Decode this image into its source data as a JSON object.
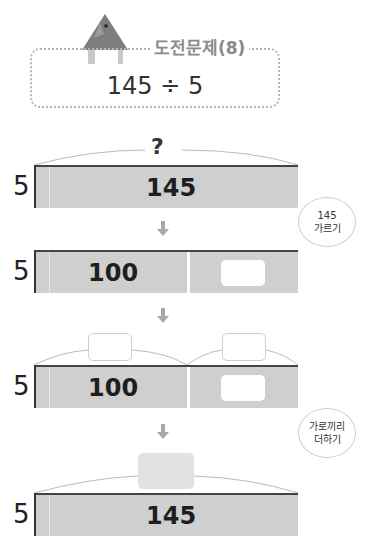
{
  "header": {
    "title": "도전문제(8)",
    "problem": "145 ÷ 5",
    "icon": "triangle-house-icon"
  },
  "steps": [
    {
      "side_label": "5",
      "top_label": "?",
      "segments": [
        {
          "value": "145"
        }
      ]
    },
    {
      "side_label": "5",
      "segments": [
        {
          "value": "100"
        },
        {
          "value": ""
        }
      ]
    },
    {
      "side_label": "5",
      "segments": [
        {
          "value": "100",
          "top_blank": ""
        },
        {
          "value": "",
          "top_blank": ""
        }
      ]
    },
    {
      "side_label": "5",
      "top_blank": "",
      "segments": [
        {
          "value": "145"
        }
      ]
    }
  ],
  "bubbles": [
    {
      "line1": "145",
      "line2": "가르기"
    },
    {
      "line1": "가로끼리",
      "line2": "더하기"
    }
  ],
  "colors": {
    "bar": "#cfcfcf",
    "title": "#8a8a8a",
    "icon": "#7d7d7d"
  }
}
